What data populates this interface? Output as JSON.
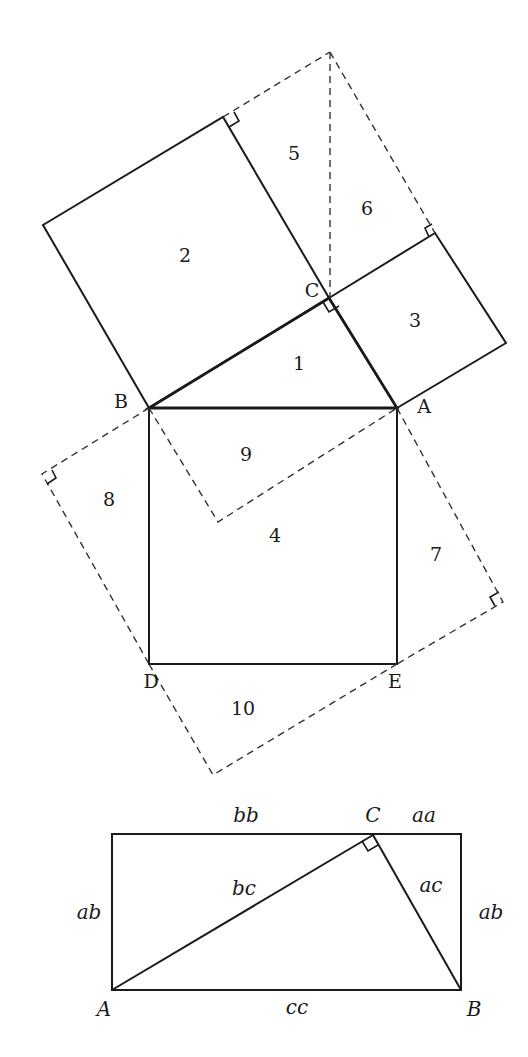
{
  "figure1": {
    "vertices": {
      "A": "A",
      "B": "B",
      "C": "C",
      "D": "D",
      "E": "E"
    },
    "regions": [
      "1",
      "2",
      "3",
      "4",
      "5",
      "6",
      "7",
      "8",
      "9",
      "10"
    ]
  },
  "figure2": {
    "vertices": {
      "A": "A",
      "B": "B",
      "C": "C"
    },
    "labels": {
      "top_left": "bb",
      "top_right": "aa",
      "left": "ab",
      "right": "ab",
      "hyp_left": "bc",
      "hyp_right": "ac",
      "bottom": "cc"
    }
  }
}
